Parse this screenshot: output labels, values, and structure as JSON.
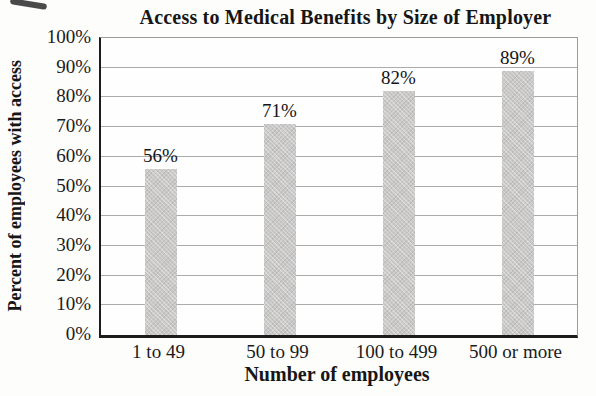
{
  "chart_data": {
    "type": "bar",
    "title": "Access to Medical Benefits by Size of Employer",
    "xlabel": "Number of employees",
    "ylabel": "Percent of employees with access",
    "categories": [
      "1 to 49",
      "50 to 99",
      "100 to 499",
      "500 or more"
    ],
    "values": [
      56,
      71,
      82,
      89
    ],
    "data_labels": [
      "56%",
      "71%",
      "82%",
      "89%"
    ],
    "y_ticks": [
      "0%",
      "10%",
      "20%",
      "30%",
      "40%",
      "50%",
      "60%",
      "70%",
      "80%",
      "90%",
      "100%"
    ],
    "ylim": [
      0,
      100
    ],
    "grid": true,
    "legend": false,
    "bar_color": "#cac9c8",
    "gridline_color": "#ababab",
    "axis_color": "#1c1c1c",
    "text_color": "#1a1a1a",
    "background_color": "#fdfdfc"
  }
}
